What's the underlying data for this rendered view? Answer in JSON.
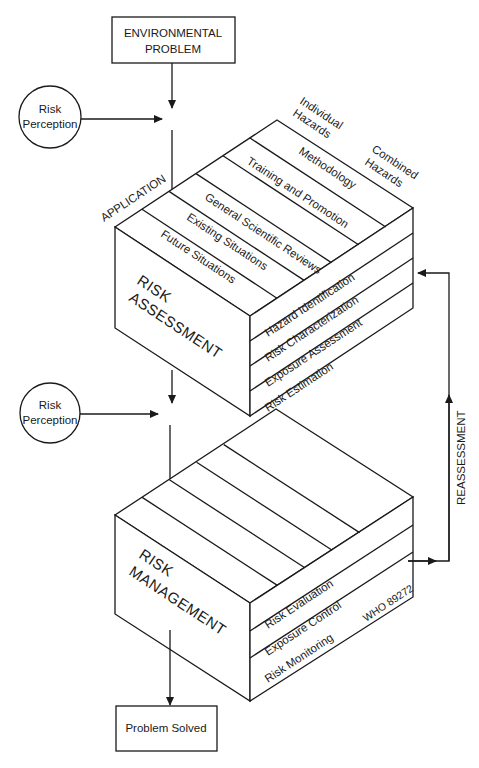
{
  "diagram": {
    "start_box": {
      "line1": "ENVIRONMENTAL",
      "line2": "PROBLEM"
    },
    "risk_perception_1": {
      "line1": "Risk",
      "line2": "Perception"
    },
    "risk_perception_2": {
      "line1": "Risk",
      "line2": "Perception"
    },
    "risk_assessment": {
      "title_line1": "RISK",
      "title_line2": "ASSESSMENT",
      "axis_left_label": "APPLICATION",
      "axis_top_label_1": {
        "line1": "Individual",
        "line2": "Hazards"
      },
      "axis_top_label_2": {
        "line1": "Combined",
        "line2": "Hazards"
      },
      "top_strips": [
        "Future Situations",
        "Existing Situations",
        "General Scientific Reviews",
        "Training and Promotion",
        "Methodology"
      ],
      "side_layers": [
        "Hazard Identification",
        "Risk Characterization",
        "Exposure Assessment",
        "Risk Estimation"
      ]
    },
    "risk_management": {
      "title_line1": "RISK",
      "title_line2": "MANAGEMENT",
      "side_layers": [
        "Risk Evaluation",
        "Exposure Control",
        "Risk Monitoring"
      ],
      "top_strip_count": 5
    },
    "feedback_label": "REASSESSMENT",
    "end_box": {
      "label": "Problem Solved"
    },
    "figure_code": "WHO 89272"
  }
}
